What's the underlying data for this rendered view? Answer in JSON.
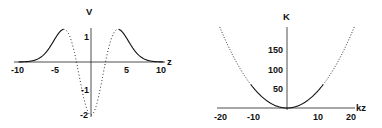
{
  "chart_data": [
    {
      "type": "line",
      "title": "",
      "xlabel": "z",
      "ylabel": "V",
      "xlim": [
        -10,
        10
      ],
      "ylim": [
        -2,
        1.3
      ],
      "xticks": [
        "-10",
        "-5",
        "5",
        "10"
      ],
      "yticks": [
        "1",
        "-1",
        "-2"
      ],
      "grid": false,
      "legend": null,
      "style_note": "solid for |z| > ~3.8, dotted inside",
      "series": [
        {
          "name": "V(z)",
          "x": [
            -10,
            -8,
            -6,
            -5,
            -4,
            -3,
            -2,
            -1,
            0,
            1,
            2,
            3,
            4,
            5,
            6,
            8,
            10
          ],
          "y": [
            0.0,
            0.05,
            0.48,
            0.85,
            1.21,
            1.06,
            0.0,
            -1.35,
            -2.0,
            -1.35,
            0.0,
            1.06,
            1.21,
            0.85,
            0.48,
            0.05,
            0.0
          ]
        }
      ]
    },
    {
      "type": "line",
      "title": "",
      "xlabel": "kz",
      "ylabel": "K",
      "xlim": [
        -20,
        20
      ],
      "ylim": [
        0,
        200
      ],
      "xticks": [
        "-20",
        "-10",
        "10",
        "20"
      ],
      "yticks": [
        "50",
        "100",
        "150"
      ],
      "grid": false,
      "legend": null,
      "style_note": "solid near origin, dotted for |kz| > ~10",
      "series": [
        {
          "name": "K(kz)",
          "x": [
            -20,
            -15,
            -10,
            -5,
            0,
            5,
            10,
            15,
            20
          ],
          "y": [
            200,
            112.5,
            50,
            12.5,
            0,
            12.5,
            50,
            112.5,
            200
          ]
        }
      ]
    }
  ],
  "left": {
    "ylabel": "V",
    "xlabel": "z",
    "xticks": [
      "-10",
      "-5",
      "5",
      "10"
    ],
    "yticks": [
      "1",
      "-1",
      "-2"
    ]
  },
  "right": {
    "ylabel": "K",
    "xlabel": "kz",
    "xticks": [
      "-20",
      "-10",
      "10",
      "20"
    ],
    "yticks": [
      "50",
      "100",
      "150"
    ]
  }
}
